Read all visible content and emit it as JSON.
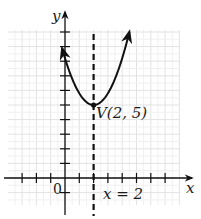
{
  "chart_data": {
    "type": "line",
    "title": "",
    "xlabel": "x",
    "ylabel": "y",
    "origin_label": "0",
    "xlim": [
      -3,
      7
    ],
    "ylim": [
      -1,
      11
    ],
    "x_ticks": [
      -3,
      -2,
      -1,
      1,
      2,
      3,
      4,
      5,
      6,
      7
    ],
    "y_ticks": [
      1,
      2,
      3,
      4,
      5,
      6,
      7,
      8,
      9,
      10
    ],
    "grid": true,
    "legend": null,
    "series": [
      {
        "name": "parabola",
        "equation": "y = 0.8(x - 2)^2 + 5",
        "x": [
          -0.2,
          0,
          0.5,
          1,
          1.5,
          2,
          2.5,
          3,
          3.5,
          4,
          4.5
        ],
        "y": [
          8.9,
          8.2,
          6.8,
          5.8,
          5.2,
          5.0,
          5.2,
          5.8,
          6.8,
          8.2,
          10.0
        ],
        "arrows_at_ends": true,
        "color": "#111111"
      }
    ],
    "annotations": [
      {
        "type": "point",
        "label": "V(2, 5)",
        "x": 2,
        "y": 5
      },
      {
        "type": "vertical_dashed_line",
        "label": "x = 2",
        "x": 2
      }
    ]
  },
  "labels": {
    "x_axis": "x",
    "y_axis": "y",
    "origin": "0",
    "vertex": "V(2, 5)",
    "axis_of_symmetry": "x = 2"
  }
}
